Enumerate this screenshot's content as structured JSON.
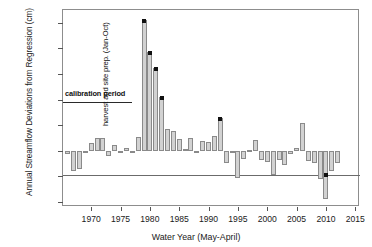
{
  "chart_data": {
    "type": "bar",
    "title": "",
    "xlabel": "Water Year (May-April)",
    "ylabel": "Annual Streamflow Deviations from Regression (cm)",
    "xlim": [
      1965.2,
      2015.8
    ],
    "ylim": [
      -11.0,
      27.5
    ],
    "yticks": [
      25,
      20,
      15,
      10,
      5,
      0,
      -5,
      -10
    ],
    "ytick_labels": [
      "25",
      "20",
      "15",
      "10",
      "5",
      "0",
      "−5",
      "−10"
    ],
    "xticks": [
      1970,
      1975,
      1980,
      1985,
      1990,
      1995,
      2000,
      2005,
      2010,
      2015
    ],
    "xtick_labels": [
      "1970",
      "1975",
      "1980",
      "1985",
      "1990",
      "1995",
      "2000",
      "2005",
      "2010",
      "2015"
    ],
    "grid": false,
    "legend": "none",
    "bar_color": "#d2d2d2",
    "bar_edge_color": "#8a8a8a",
    "marker_color": "#111111",
    "x": [
      1966,
      1967,
      1968,
      1969,
      1970,
      1971,
      1972,
      1973,
      1974,
      1975,
      1976,
      1977,
      1978,
      1979,
      1980,
      1981,
      1982,
      1983,
      1984,
      1985,
      1986,
      1987,
      1988,
      1989,
      1990,
      1991,
      1992,
      1993,
      1994,
      1995,
      1996,
      1997,
      1998,
      1999,
      2000,
      2001,
      2002,
      2003,
      2004,
      2005,
      2006,
      2007,
      2008,
      2009,
      2010,
      2011,
      2012
    ],
    "values": [
      -0.6,
      -4.0,
      -3.5,
      -0.3,
      1.6,
      2.5,
      2.4,
      -1.0,
      1.2,
      -0.4,
      0.6,
      -0.3,
      2.7,
      25.6,
      19.3,
      16.2,
      10.4,
      4.2,
      3.9,
      2.3,
      0.4,
      2.5,
      -0.4,
      1.9,
      1.7,
      2.9,
      6.4,
      -2.4,
      -0.5,
      -5.3,
      -1.6,
      0.2,
      2.1,
      -1.8,
      -2.3,
      -4.8,
      -1.9,
      -2.7,
      -0.7,
      0.6,
      5.4,
      -2.1,
      -2.5,
      -5.6,
      -9.5,
      -3.9,
      -2.4
    ],
    "markers": [
      {
        "x": 1979,
        "y": 25.6
      },
      {
        "x": 1980,
        "y": 19.3
      },
      {
        "x": 1981,
        "y": 16.2
      },
      {
        "x": 1982,
        "y": 10.4
      },
      {
        "x": 1992,
        "y": 6.4
      },
      {
        "x": 2010,
        "y": -4.5
      }
    ],
    "annotations": [
      {
        "name": "calibration-period",
        "text": "calibration period",
        "x_start": 1965.2,
        "x_end": 1977.0,
        "y": 9.5
      },
      {
        "name": "harvest-site-prep",
        "text": "harvest and site prep. (Jan-Oct)",
        "x": 1978.2,
        "rotation": 90
      }
    ]
  }
}
